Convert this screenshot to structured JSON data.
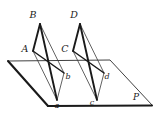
{
  "figure": {
    "background_color": "#ffffff",
    "stroke_color": "#1a1a1a",
    "thin_stroke_color": "#3a3a3a"
  },
  "labels": {
    "B": "B",
    "D": "D",
    "A": "A",
    "C": "C",
    "b": "b",
    "d": "d",
    "a": "a",
    "c": "c",
    "P": "P"
  },
  "geometry": {
    "plane": {
      "name": "plane-P",
      "points": "8,61 110,60 152,105 48,106"
    },
    "left_parallelogram": {
      "name": "parallelogram-ABba",
      "apex_B": "40,24",
      "vertex_A": "33,51",
      "vertex_b": "64,73",
      "vertex_a": "57,100",
      "thick_edges": [
        "40,24 33,51",
        "40,24 57,100",
        "33,51 64,73"
      ],
      "thin_edges": [
        "33,51 57,100",
        "40,24 64,73",
        "64,73 57,100"
      ]
    },
    "right_parallelogram": {
      "name": "parallelogram-CDdc",
      "apex_D": "80,24",
      "vertex_C": "73,51",
      "vertex_d": "104,73",
      "vertex_c": "97,100",
      "thick_edges": [
        "80,24 73,51",
        "80,24 97,100",
        "73,51 104,73"
      ],
      "thin_edges": [
        "73,51 97,100",
        "80,24 104,73",
        "104,73 97,100"
      ]
    },
    "label_positions": {
      "B": {
        "x": 33,
        "y": 18
      },
      "D": {
        "x": 74,
        "y": 18
      },
      "A": {
        "x": 25,
        "y": 52
      },
      "C": {
        "x": 65,
        "y": 52
      },
      "b": {
        "x": 68,
        "y": 79
      },
      "d": {
        "x": 107,
        "y": 79
      },
      "a": {
        "x": 56,
        "y": 108
      },
      "c": {
        "x": 92,
        "y": 105
      },
      "P": {
        "x": 135,
        "y": 100
      }
    }
  }
}
